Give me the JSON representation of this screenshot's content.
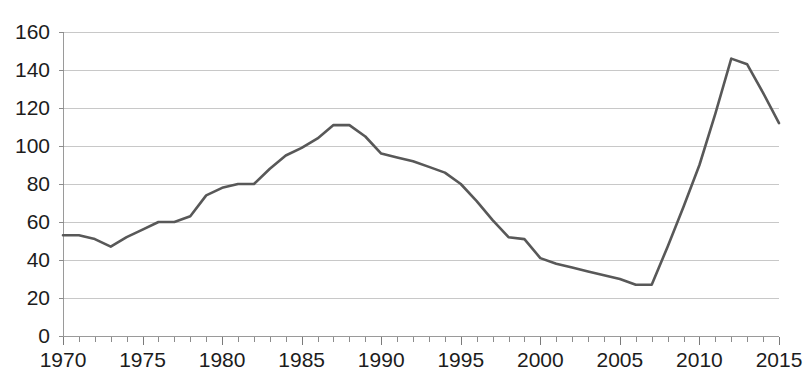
{
  "chart_data": {
    "type": "line",
    "title": "",
    "xlabel": "",
    "ylabel": "",
    "xlim": [
      1970,
      2015
    ],
    "ylim": [
      0,
      160
    ],
    "grid": true,
    "legend": false,
    "y_ticks": [
      0,
      20,
      40,
      60,
      80,
      100,
      120,
      140,
      160
    ],
    "y_tick_labels": [
      "0",
      "20",
      "40",
      "60",
      "80",
      "100",
      "120",
      "140",
      "160"
    ],
    "x_ticks": [
      1970,
      1975,
      1980,
      1985,
      1990,
      1995,
      2000,
      2005,
      2010,
      2015
    ],
    "x_tick_labels": [
      "1970",
      "1975",
      "1980",
      "1985",
      "1990",
      "1995",
      "2000",
      "2005",
      "2010",
      "2015"
    ],
    "x_minor_tick_step": 1,
    "line_color": "#585858",
    "gridline_color": "#c8c8c8",
    "axis_color": "#9a9a9a",
    "x": [
      1970,
      1971,
      1972,
      1973,
      1974,
      1975,
      1976,
      1977,
      1978,
      1979,
      1980,
      1981,
      1982,
      1983,
      1984,
      1985,
      1986,
      1987,
      1988,
      1989,
      1990,
      1991,
      1992,
      1993,
      1994,
      1995,
      1996,
      1997,
      1998,
      1999,
      2000,
      2001,
      2002,
      2003,
      2004,
      2005,
      2006,
      2007,
      2008,
      2009,
      2010,
      2011,
      2012,
      2013,
      2014,
      2015
    ],
    "series": [
      {
        "name": "value",
        "values": [
          53,
          53,
          51,
          47,
          52,
          56,
          60,
          60,
          63,
          74,
          78,
          80,
          80,
          88,
          95,
          99,
          104,
          111,
          111,
          105,
          96,
          94,
          92,
          89,
          86,
          80,
          71,
          61,
          52,
          51,
          41,
          38,
          36,
          34,
          32,
          30,
          27,
          27,
          47,
          68,
          90,
          117,
          146,
          143,
          128,
          112
        ]
      }
    ]
  },
  "caption": {
    "text": ""
  },
  "layout": {
    "plot_left": 63,
    "plot_right": 779,
    "plot_top": 32,
    "plot_bottom": 336
  }
}
